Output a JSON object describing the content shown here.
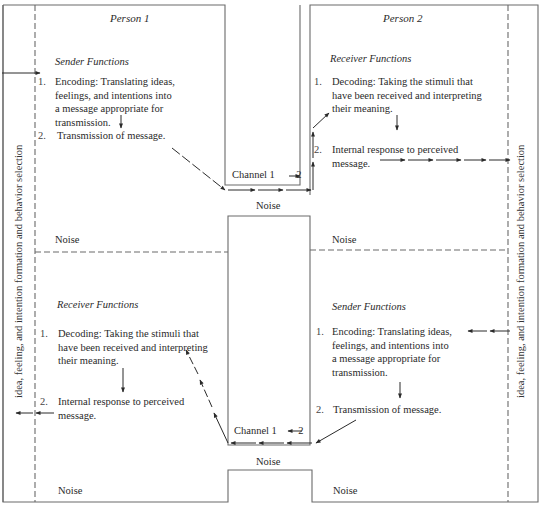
{
  "diagram": {
    "person1": {
      "title": "Person 1",
      "top_section": {
        "heading": "Sender Functions",
        "items": [
          {
            "num": "1.",
            "lines": [
              "Encoding: Translating ideas,",
              "feelings, and intentions into",
              "a message appropriate for",
              "transmission."
            ]
          },
          {
            "num": "2.",
            "lines": [
              "Transmission of message."
            ]
          }
        ],
        "noise_label": "Noise"
      },
      "bottom_section": {
        "heading": "Receiver Functions",
        "items": [
          {
            "num": "1.",
            "lines": [
              "Decoding: Taking the stimuli that",
              "have been received and interpreting",
              "their meaning."
            ]
          },
          {
            "num": "2.",
            "lines": [
              "Internal response to perceived",
              "message."
            ]
          }
        ],
        "noise_label": "Noise"
      },
      "side_label": "idea, feeling, and intention formation and behavior selection"
    },
    "person2": {
      "title": "Person 2",
      "top_section": {
        "heading": "Receiver Functions",
        "items": [
          {
            "num": "1.",
            "lines": [
              "Decoding: Taking the stimuli that",
              "have been received and interpreting",
              "their meaning."
            ]
          },
          {
            "num": "2.",
            "lines": [
              "Internal response to perceived",
              "message."
            ]
          }
        ],
        "noise_label": "Noise"
      },
      "bottom_section": {
        "heading": "Sender Functions",
        "items": [
          {
            "num": "1.",
            "lines": [
              "Encoding: Translating ideas,",
              "feelings, and intentions into",
              "a message appropriate for",
              "transmission."
            ]
          },
          {
            "num": "2.",
            "lines": [
              "Transmission of message."
            ]
          }
        ],
        "noise_label": "Noise"
      },
      "side_label": "idea, feeling, and intention formation and behavior selection"
    },
    "channels": {
      "upper": {
        "label": "Channel 1",
        "arrow": "→",
        "target": "2",
        "noise_label": "Noise"
      },
      "lower": {
        "label": "Channel 1",
        "arrow": "←",
        "target": "2",
        "noise_label": "Noise"
      }
    },
    "colors": {
      "line": "#6a6a6a",
      "text": "#2a2a2a",
      "background": "#ffffff"
    }
  }
}
